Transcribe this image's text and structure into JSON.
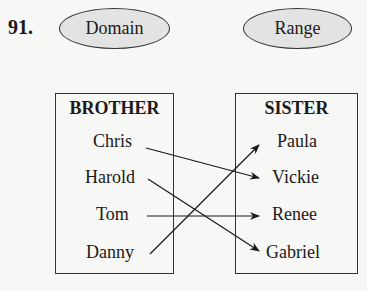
{
  "problem_number": "91.",
  "domain": {
    "label": "Domain",
    "set_title": "BROTHER",
    "items": [
      "Chris",
      "Harold",
      "Tom",
      "Danny"
    ]
  },
  "range": {
    "label": "Range",
    "set_title": "SISTER",
    "items": [
      "Paula",
      "Vickie",
      "Renee",
      "Gabriel"
    ]
  },
  "mappings": [
    {
      "from": "Chris",
      "to": "Vickie"
    },
    {
      "from": "Harold",
      "to": "Gabriel"
    },
    {
      "from": "Tom",
      "to": "Renee"
    },
    {
      "from": "Danny",
      "to": "Paula"
    }
  ],
  "colors": {
    "ellipse_fill": "#e3e3e3",
    "stroke": "#333333",
    "background": "#f7f7f5"
  }
}
